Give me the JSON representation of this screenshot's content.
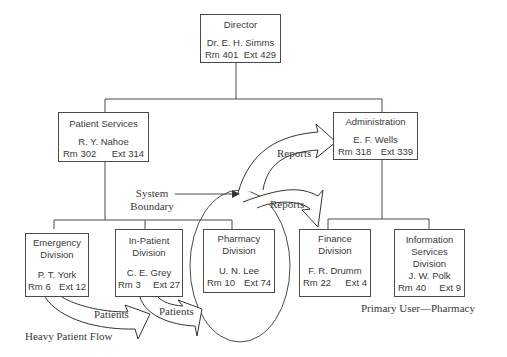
{
  "nodes": {
    "director": {
      "title": "Director",
      "name": "Dr. E. H. Simms",
      "room": "Rm 401",
      "ext": "Ext 429"
    },
    "patient_services": {
      "title": "Patient Services",
      "name": "R. Y. Nahoe",
      "room": "Rm 302",
      "ext": "Ext 314"
    },
    "administration": {
      "title": "Administration",
      "name": "E. F. Wells",
      "room": "Rm 318",
      "ext": "Ext 339"
    },
    "emergency": {
      "title1": "Emergency",
      "title2": "Division",
      "name": "P. T. York",
      "room": "Rm 6",
      "ext": "Ext 12"
    },
    "inpatient": {
      "title1": "In-Patient",
      "title2": "Division",
      "name": "C. E. Grey",
      "room": "Rm 3",
      "ext": "Ext 27"
    },
    "pharmacy": {
      "title1": "Pharmacy",
      "title2": "Division",
      "name": "U. N. Lee",
      "room": "Rm 10",
      "ext": "Ext 74"
    },
    "finance": {
      "title1": "Finance",
      "title2": "Division",
      "name": "F. R. Drumm",
      "room": "Rm 22",
      "ext": "Ext 4"
    },
    "info_services": {
      "title1": "Information",
      "title2": "Services",
      "title3": "Division",
      "name": "J. W. Polk",
      "room": "Rm 40",
      "ext": "Ext 9"
    }
  },
  "annotations": {
    "system_boundary_1": "System",
    "system_boundary_2": "Boundary",
    "reports_upper": "Reports",
    "reports_lower": "Reports",
    "patients_1": "Patients",
    "patients_2": "Patients",
    "heavy_flow": "Heavy Patient Flow",
    "primary_user": "Primary User—Pharmacy"
  }
}
